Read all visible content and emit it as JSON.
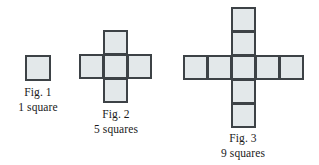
{
  "diagram": {
    "background_color": "#ffffff",
    "square_fill_color": "#e3e8ea",
    "square_border_color": "#3d4246",
    "text_color": "#1a1a1a",
    "figures": [
      {
        "id": "fig-1",
        "caption_line1": "Fig. 1",
        "caption_line2": "1 square",
        "square_count": 1,
        "cell_size": 25,
        "shape": "single-square",
        "cells": [
          {
            "col": 0,
            "row": 0
          }
        ]
      },
      {
        "id": "fig-2",
        "caption_line1": "Fig. 2",
        "caption_line2": "5 squares",
        "square_count": 5,
        "cell_size": 24,
        "shape": "plus",
        "cells": [
          {
            "col": 1,
            "row": 0
          },
          {
            "col": 0,
            "row": 1
          },
          {
            "col": 1,
            "row": 1
          },
          {
            "col": 2,
            "row": 1
          },
          {
            "col": 1,
            "row": 2
          }
        ]
      },
      {
        "id": "fig-3",
        "caption_line1": "Fig. 3",
        "caption_line2": "9 squares",
        "square_count": 9,
        "cell_size": 24,
        "shape": "plus",
        "cells": [
          {
            "col": 2,
            "row": 0
          },
          {
            "col": 2,
            "row": 1
          },
          {
            "col": 0,
            "row": 2
          },
          {
            "col": 1,
            "row": 2
          },
          {
            "col": 2,
            "row": 2
          },
          {
            "col": 3,
            "row": 2
          },
          {
            "col": 4,
            "row": 2
          },
          {
            "col": 2,
            "row": 3
          },
          {
            "col": 2,
            "row": 4
          }
        ]
      }
    ]
  }
}
